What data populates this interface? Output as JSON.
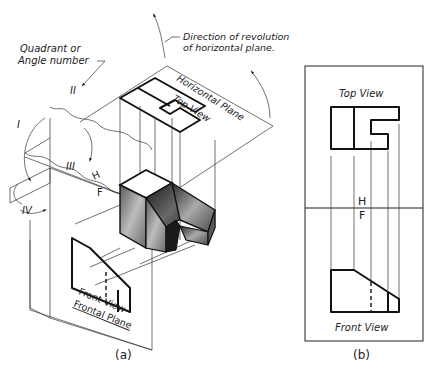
{
  "figure_a": {
    "caption": "(a)",
    "annotations": {
      "quadrant_line1": "Quadrant or",
      "quadrant_line2": "Angle number",
      "revolution_line1": "Direction of revolution",
      "revolution_line2": "of horizontal plane."
    },
    "planes": {
      "horizontal": "Horizontal Plane",
      "frontal": "Frontal Plane"
    },
    "views": {
      "top": "Top View",
      "front": "Front View"
    },
    "fold_line": {
      "upper": "H",
      "lower": "F"
    },
    "quadrants": [
      "I",
      "II",
      "III",
      "IV"
    ]
  },
  "figure_b": {
    "caption": "(b)",
    "views": {
      "top": "Top View",
      "front": "Front View"
    },
    "fold_line": {
      "upper": "H",
      "lower": "F"
    }
  }
}
